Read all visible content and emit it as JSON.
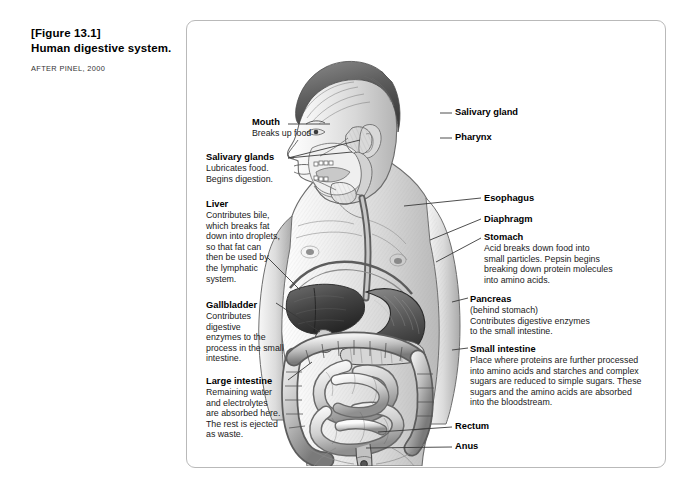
{
  "caption": {
    "figure_number": "[Figure 13.1]",
    "title": "Human digestive system.",
    "credit": "AFTER PINEL, 2000"
  },
  "figure": {
    "style": "pencil-shaded grayscale drawing of a male figure in profile, head facing left, torso opened to show digestive organs",
    "border_color": "#b9b9b9",
    "background_color": "#ffffff"
  },
  "labels": {
    "left": [
      {
        "id": "mouth",
        "heading": "Mouth",
        "body": "Breaks up food"
      },
      {
        "id": "salivary-glands",
        "heading": "Salivary glands",
        "body": "Lubricates food.\nBegins digestion."
      },
      {
        "id": "liver",
        "heading": "Liver",
        "body": "Contributes bile,\nwhich breaks fat\ndown into droplets,\nso that fat can\nthen be used by\nthe lymphatic\nsystem."
      },
      {
        "id": "gallbladder",
        "heading": "Gallbladder",
        "body": "Contributes\ndigestive\nenzymes to the\nprocess in the small\nintestine."
      },
      {
        "id": "large-intestine",
        "heading": "Large intestine",
        "body": "Remaining water\nand electrolytes\nare absorbed here.\nThe rest is ejected\nas waste."
      }
    ],
    "right": [
      {
        "id": "salivary-gland",
        "heading": "Salivary gland",
        "body": ""
      },
      {
        "id": "pharynx",
        "heading": "Pharynx",
        "body": ""
      },
      {
        "id": "esophagus",
        "heading": "Esophagus",
        "body": ""
      },
      {
        "id": "diaphragm",
        "heading": "Diaphragm",
        "body": ""
      },
      {
        "id": "stomach",
        "heading": "Stomach",
        "body": "Acid breaks down food into\nsmall particles. Pepsin begins\nbreaking down protein molecules\ninto amino acids."
      },
      {
        "id": "pancreas",
        "heading": "Pancreas",
        "body": "(behind stomach)\nContributes digestive enzymes\nto the small intestine."
      },
      {
        "id": "small-intestine",
        "heading": "Small intestine",
        "body": "Place where proteins are further processed\ninto amino acids and starches and complex\nsugars are reduced to simple sugars. These\nsugars and the amino acids are absorbed\ninto the bloodstream."
      },
      {
        "id": "rectum",
        "heading": "Rectum",
        "body": ""
      },
      {
        "id": "anus",
        "heading": "Anus",
        "body": ""
      }
    ]
  },
  "colors": {
    "text": "#000000",
    "body_text": "#1a1a1a",
    "credit_text": "#333333",
    "leader_line": "#3a3a3a",
    "frame": "#b9b9b9"
  }
}
